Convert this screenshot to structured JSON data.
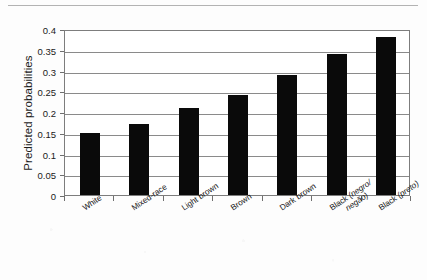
{
  "figure": {
    "background_color": "#fdfdfd",
    "rule_color": "#b3b3b3",
    "axis_color": "#7d7d7d",
    "bar_color": "#0a0a0a"
  },
  "chart_data": {
    "type": "bar",
    "title": "",
    "xlabel": "",
    "ylabel": "Predicted probabilities",
    "ylim": [
      0,
      0.4
    ],
    "yticks": [
      0,
      0.05,
      0.1,
      0.15,
      0.2,
      0.25,
      0.3,
      0.35,
      0.4
    ],
    "ytick_labels": [
      "0",
      "0.05",
      "0.1",
      "0.15",
      "0.2",
      "0.25",
      "0.3",
      "0.35",
      "0.4"
    ],
    "grid": true,
    "legend": null,
    "categories": [
      "White",
      "Mixed-race",
      "Light brown",
      "Brown",
      "Dark brown",
      "Black (negro/negão)",
      "Black (preto)"
    ],
    "category_label_lines": [
      [
        "White"
      ],
      [
        "Mixed-race"
      ],
      [
        "Light brown"
      ],
      [
        "Brown"
      ],
      [
        "Dark brown"
      ],
      [
        "Black (negro/",
        "negão)"
      ],
      [
        "Black (preto)"
      ]
    ],
    "values": [
      0.15,
      0.17,
      0.21,
      0.24,
      0.29,
      0.34,
      0.38
    ]
  }
}
